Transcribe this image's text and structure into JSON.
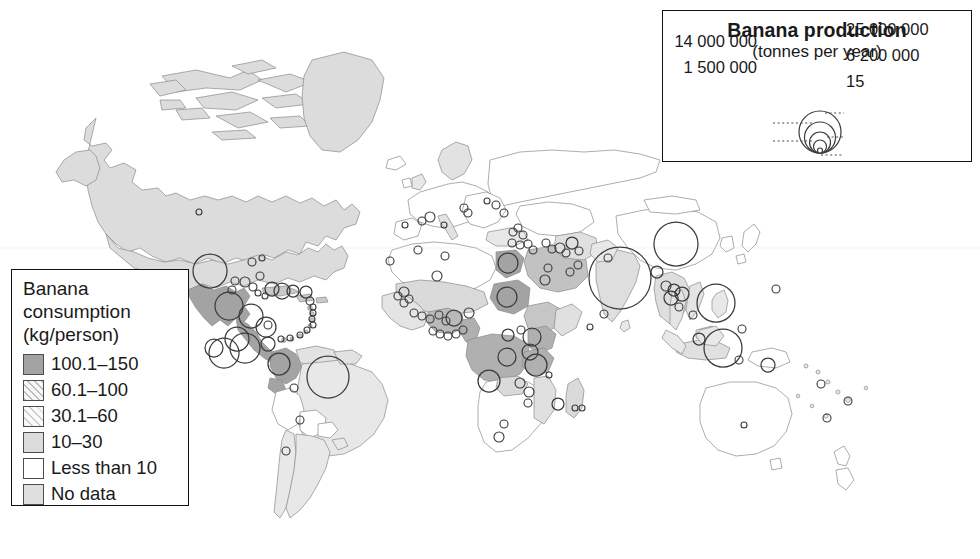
{
  "figure": {
    "name": "world-banana-map"
  },
  "production_legend": {
    "title": "Banana production",
    "subtitle": "(tonnes per year)",
    "left_labels": [
      "14 000 000",
      "1 500 000"
    ],
    "right_labels": [
      "25 000 000",
      "6 200 000",
      "15"
    ],
    "symbols": [
      {
        "label": "25 000 000",
        "value": 25000000,
        "radius_px": 21
      },
      {
        "label": "14 000 000",
        "value": 14000000,
        "radius_px": 15.5
      },
      {
        "label": "6 200 000",
        "value": 6200000,
        "radius_px": 10.5
      },
      {
        "label": "1 500 000",
        "value": 1500000,
        "radius_px": 6.5
      },
      {
        "label": "15",
        "value": 15,
        "radius_px": 2.5
      }
    ]
  },
  "consumption_legend": {
    "title_line1": "Banana",
    "title_line2": "consumption",
    "title_line3": "(kg/person)",
    "classes": [
      {
        "label": "100.1–150",
        "swatch": "sw-1",
        "color": "#a3a3a3"
      },
      {
        "label": "60.1–100",
        "swatch": "sw-2",
        "color": "#f2f2f2"
      },
      {
        "label": "30.1–60",
        "swatch": "sw-3",
        "color": "#f5f5f5"
      },
      {
        "label": "10–30",
        "swatch": "sw-4",
        "color": "#dcdcdc"
      },
      {
        "label": "Less than 10",
        "swatch": "sw-5",
        "color": "#ffffff"
      },
      {
        "label": "No data",
        "swatch": "sw-6",
        "color": "#dfdfdf"
      }
    ]
  },
  "chart_data": {
    "type": "map",
    "symbol_legend_units": "tonnes per year",
    "choropleth_units": "kg/person",
    "choropleth_classes": [
      "100.1-150",
      "60.1-100",
      "30.1-60",
      "10-30",
      "Less than 10",
      "No data"
    ],
    "symbol_breaks": [
      25000000,
      14000000,
      6200000,
      1500000,
      15
    ],
    "production_circles": [
      {
        "x": 620,
        "y": 278,
        "r": 31
      },
      {
        "x": 676,
        "y": 244,
        "r": 22
      },
      {
        "x": 716,
        "y": 303,
        "r": 19
      },
      {
        "x": 723,
        "y": 348,
        "r": 19
      },
      {
        "x": 328,
        "y": 377,
        "r": 21
      },
      {
        "x": 210,
        "y": 271,
        "r": 17
      },
      {
        "x": 245,
        "y": 348,
        "r": 15
      },
      {
        "x": 229,
        "y": 306,
        "r": 14
      },
      {
        "x": 251,
        "y": 316,
        "r": 12
      },
      {
        "x": 237,
        "y": 339,
        "r": 12
      },
      {
        "x": 224,
        "y": 353,
        "r": 15
      },
      {
        "x": 266,
        "y": 327,
        "r": 10
      },
      {
        "x": 279,
        "y": 364,
        "r": 11
      },
      {
        "x": 268,
        "y": 344,
        "r": 7
      },
      {
        "x": 214,
        "y": 348,
        "r": 9
      },
      {
        "x": 272,
        "y": 289,
        "r": 7
      },
      {
        "x": 282,
        "y": 291,
        "r": 8
      },
      {
        "x": 293,
        "y": 291,
        "r": 6
      },
      {
        "x": 306,
        "y": 292,
        "r": 6
      },
      {
        "x": 245,
        "y": 282,
        "r": 5
      },
      {
        "x": 253,
        "y": 287,
        "r": 4
      },
      {
        "x": 235,
        "y": 281,
        "r": 4
      },
      {
        "x": 232,
        "y": 290,
        "r": 4
      },
      {
        "x": 260,
        "y": 276,
        "r": 4
      },
      {
        "x": 258,
        "y": 293,
        "r": 3
      },
      {
        "x": 265,
        "y": 296,
        "r": 3
      },
      {
        "x": 310,
        "y": 301,
        "r": 4
      },
      {
        "x": 313,
        "y": 307,
        "r": 3
      },
      {
        "x": 313,
        "y": 313,
        "r": 3
      },
      {
        "x": 312,
        "y": 319,
        "r": 3
      },
      {
        "x": 313,
        "y": 325,
        "r": 3
      },
      {
        "x": 307,
        "y": 330,
        "r": 3
      },
      {
        "x": 300,
        "y": 335,
        "r": 3
      },
      {
        "x": 290,
        "y": 338,
        "r": 3
      },
      {
        "x": 281,
        "y": 339,
        "r": 3
      },
      {
        "x": 199,
        "y": 212,
        "r": 3
      },
      {
        "x": 252,
        "y": 262,
        "r": 4
      },
      {
        "x": 262,
        "y": 258,
        "r": 3
      },
      {
        "x": 286,
        "y": 451,
        "r": 4
      },
      {
        "x": 300,
        "y": 420,
        "r": 4
      },
      {
        "x": 294,
        "y": 388,
        "r": 4
      },
      {
        "x": 268,
        "y": 325,
        "r": 4
      },
      {
        "x": 422,
        "y": 221,
        "r": 4
      },
      {
        "x": 430,
        "y": 217,
        "r": 5
      },
      {
        "x": 405,
        "y": 225,
        "r": 3
      },
      {
        "x": 444,
        "y": 225,
        "r": 3
      },
      {
        "x": 464,
        "y": 208,
        "r": 4
      },
      {
        "x": 468,
        "y": 213,
        "r": 4
      },
      {
        "x": 487,
        "y": 201,
        "r": 3
      },
      {
        "x": 496,
        "y": 205,
        "r": 4
      },
      {
        "x": 504,
        "y": 213,
        "r": 4
      },
      {
        "x": 513,
        "y": 232,
        "r": 4
      },
      {
        "x": 518,
        "y": 228,
        "r": 4
      },
      {
        "x": 523,
        "y": 235,
        "r": 4
      },
      {
        "x": 512,
        "y": 243,
        "r": 4
      },
      {
        "x": 520,
        "y": 245,
        "r": 4
      },
      {
        "x": 528,
        "y": 244,
        "r": 4
      },
      {
        "x": 533,
        "y": 250,
        "r": 4
      },
      {
        "x": 546,
        "y": 243,
        "r": 4
      },
      {
        "x": 552,
        "y": 249,
        "r": 4
      },
      {
        "x": 560,
        "y": 248,
        "r": 5
      },
      {
        "x": 566,
        "y": 253,
        "r": 4
      },
      {
        "x": 572,
        "y": 243,
        "r": 6
      },
      {
        "x": 579,
        "y": 251,
        "r": 4
      },
      {
        "x": 508,
        "y": 263,
        "r": 10
      },
      {
        "x": 545,
        "y": 280,
        "r": 5
      },
      {
        "x": 548,
        "y": 268,
        "r": 4
      },
      {
        "x": 570,
        "y": 272,
        "r": 4
      },
      {
        "x": 578,
        "y": 265,
        "r": 4
      },
      {
        "x": 390,
        "y": 261,
        "r": 4
      },
      {
        "x": 418,
        "y": 250,
        "r": 4
      },
      {
        "x": 445,
        "y": 256,
        "r": 4
      },
      {
        "x": 437,
        "y": 276,
        "r": 5
      },
      {
        "x": 404,
        "y": 292,
        "r": 5
      },
      {
        "x": 398,
        "y": 296,
        "r": 4
      },
      {
        "x": 409,
        "y": 299,
        "r": 4
      },
      {
        "x": 404,
        "y": 303,
        "r": 4
      },
      {
        "x": 414,
        "y": 313,
        "r": 4
      },
      {
        "x": 422,
        "y": 316,
        "r": 4
      },
      {
        "x": 430,
        "y": 319,
        "r": 4
      },
      {
        "x": 439,
        "y": 315,
        "r": 4
      },
      {
        "x": 446,
        "y": 321,
        "r": 4
      },
      {
        "x": 454,
        "y": 318,
        "r": 8
      },
      {
        "x": 469,
        "y": 313,
        "r": 5
      },
      {
        "x": 463,
        "y": 330,
        "r": 4
      },
      {
        "x": 456,
        "y": 334,
        "r": 4
      },
      {
        "x": 448,
        "y": 336,
        "r": 4
      },
      {
        "x": 440,
        "y": 334,
        "r": 4
      },
      {
        "x": 433,
        "y": 331,
        "r": 4
      },
      {
        "x": 507,
        "y": 297,
        "r": 10
      },
      {
        "x": 508,
        "y": 335,
        "r": 6
      },
      {
        "x": 521,
        "y": 330,
        "r": 4
      },
      {
        "x": 532,
        "y": 337,
        "r": 9
      },
      {
        "x": 530,
        "y": 352,
        "r": 8
      },
      {
        "x": 507,
        "y": 357,
        "r": 9
      },
      {
        "x": 536,
        "y": 365,
        "r": 11
      },
      {
        "x": 489,
        "y": 381,
        "r": 11
      },
      {
        "x": 520,
        "y": 383,
        "r": 5
      },
      {
        "x": 529,
        "y": 392,
        "r": 5
      },
      {
        "x": 528,
        "y": 403,
        "r": 4
      },
      {
        "x": 549,
        "y": 375,
        "r": 3
      },
      {
        "x": 558,
        "y": 404,
        "r": 6
      },
      {
        "x": 575,
        "y": 408,
        "r": 3
      },
      {
        "x": 582,
        "y": 408,
        "r": 3
      },
      {
        "x": 504,
        "y": 424,
        "r": 4
      },
      {
        "x": 499,
        "y": 437,
        "r": 5
      },
      {
        "x": 590,
        "y": 327,
        "r": 3
      },
      {
        "x": 608,
        "y": 258,
        "r": 4
      },
      {
        "x": 657,
        "y": 272,
        "r": 6
      },
      {
        "x": 666,
        "y": 286,
        "r": 5
      },
      {
        "x": 674,
        "y": 290,
        "r": 6
      },
      {
        "x": 671,
        "y": 298,
        "r": 7
      },
      {
        "x": 682,
        "y": 294,
        "r": 7
      },
      {
        "x": 679,
        "y": 307,
        "r": 4
      },
      {
        "x": 604,
        "y": 314,
        "r": 4
      },
      {
        "x": 693,
        "y": 315,
        "r": 4
      },
      {
        "x": 699,
        "y": 339,
        "r": 6
      },
      {
        "x": 739,
        "y": 360,
        "r": 4
      },
      {
        "x": 768,
        "y": 365,
        "r": 7
      },
      {
        "x": 776,
        "y": 289,
        "r": 4
      },
      {
        "x": 742,
        "y": 329,
        "r": 4
      },
      {
        "x": 821,
        "y": 384,
        "r": 4
      },
      {
        "x": 848,
        "y": 401,
        "r": 4
      },
      {
        "x": 827,
        "y": 418,
        "r": 4
      },
      {
        "x": 744,
        "y": 425,
        "r": 3
      }
    ]
  }
}
